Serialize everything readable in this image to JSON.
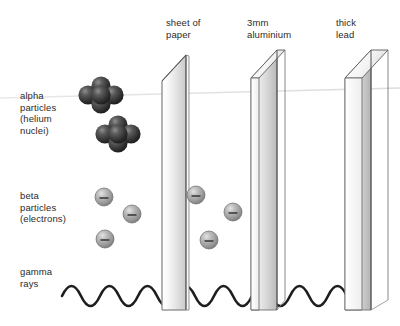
{
  "figure": {
    "width": 400,
    "height": 326,
    "background": "#ffffff",
    "stroke": "#3a3a3a",
    "text_color": "#2b2b2b"
  },
  "radiation_rows": [
    {
      "id": "alpha",
      "label": "alpha\nparticles\n(helium\nnuclei)",
      "label_lines": [
        "alpha",
        "particles",
        "(helium",
        "nuclei)"
      ],
      "particle_type": "alpha-cluster",
      "particle_color": "#3d3d3d",
      "stopped_by": "sheet of paper",
      "clusters": [
        {
          "cx": 101,
          "cy": 95,
          "r": 9.5
        },
        {
          "cx": 118,
          "cy": 134,
          "r": 9.5
        }
      ]
    },
    {
      "id": "beta",
      "label": "beta\nparticles\n(electrons)",
      "label_lines": [
        "beta",
        "particles",
        "(electrons)"
      ],
      "particle_type": "electron-sphere",
      "particle_color": "#9a9a9a",
      "particle_symbol": "−",
      "stopped_by": "3mm aluminium",
      "particles": [
        {
          "cx": 104,
          "cy": 197,
          "r": 9
        },
        {
          "cx": 132,
          "cy": 214,
          "r": 9
        },
        {
          "cx": 105,
          "cy": 239,
          "r": 9
        },
        {
          "cx": 196,
          "cy": 195,
          "r": 9
        },
        {
          "cx": 230,
          "cy": 212,
          "r": 9
        },
        {
          "cx": 209,
          "cy": 240,
          "r": 9
        }
      ]
    },
    {
      "id": "gamma",
      "label": "gamma\nrays",
      "label_lines": [
        "gamma",
        "rays"
      ],
      "particle_type": "wave",
      "wave_color": "#1d1d1d",
      "stopped_by": "thick lead",
      "wave_baseline_y": 296,
      "wave_amplitude": 14,
      "wave_start_x": 62,
      "wave_end_x": 372,
      "wave_period": 38
    }
  ],
  "barriers": [
    {
      "id": "paper",
      "label": "sheet of\npaper",
      "label_lines": [
        "sheet of",
        "paper"
      ],
      "thickness_px": 3,
      "front_x": 186,
      "top_y": 55,
      "bottom_y": 310,
      "depth_dx": -24,
      "depth_dy": 26,
      "material": "paper"
    },
    {
      "id": "aluminium",
      "label": "3mm\naluminium",
      "label_lines": [
        "3mm",
        "aluminium"
      ],
      "thickness_px": 8,
      "front_x": 277,
      "top_y": 50,
      "bottom_y": 310,
      "depth_dx": -26,
      "depth_dy": 28,
      "material": "aluminium"
    },
    {
      "id": "lead",
      "label": "thick\nlead",
      "label_lines": [
        "thick",
        "lead"
      ],
      "thickness_px": 17,
      "front_x": 371,
      "top_y": 50,
      "bottom_y": 310,
      "depth_dx": -26,
      "depth_dy": 28,
      "material": "lead"
    }
  ]
}
